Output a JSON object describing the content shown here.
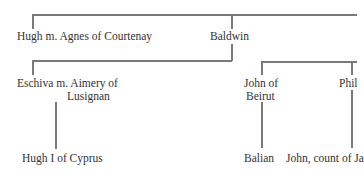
{
  "diagram": {
    "type": "family-tree",
    "nodes": {
      "hugh_agnes": "Hugh m. Agnes of Courtenay",
      "baldwin": "Baldwin",
      "eschiva_line1": "Eschiva m. Aimery of",
      "eschiva_line2": "Lusignan",
      "hugh_cyprus": "Hugh I of Cyprus",
      "john_line1": "John of",
      "john_line2": "Beirut",
      "philip_partial": "Phil",
      "balian": "Balian",
      "john_count": "John, count of Ja"
    },
    "edges": [
      [
        "top",
        "hugh_agnes"
      ],
      [
        "top",
        "baldwin"
      ],
      [
        "baldwin",
        "eschiva"
      ],
      [
        "eschiva",
        "hugh_cyprus"
      ],
      [
        "top_right",
        "john_of_beirut"
      ],
      [
        "top_right",
        "philip"
      ],
      [
        "john_of_beirut",
        "balian"
      ],
      [
        "philip",
        "john_count"
      ]
    ],
    "line_color": "#7a7a7a"
  }
}
